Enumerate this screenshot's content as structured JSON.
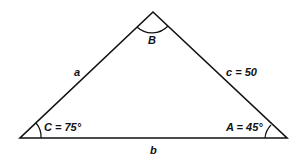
{
  "diagram": {
    "type": "triangle",
    "vertices": {
      "B": {
        "x": 153,
        "y": 12
      },
      "C": {
        "x": 20,
        "y": 138
      },
      "A": {
        "x": 287,
        "y": 138
      }
    },
    "labels": {
      "angle_B": "B",
      "angle_C": "C = 75°",
      "angle_A": "A = 45°",
      "side_a": "a",
      "side_b": "b",
      "side_c": "c = 50"
    },
    "colors": {
      "stroke": "#111111",
      "background": "#ffffff"
    }
  }
}
